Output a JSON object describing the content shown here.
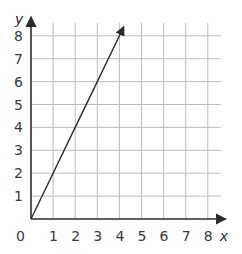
{
  "chart_data": {
    "type": "line",
    "title": "",
    "xlabel": "x",
    "ylabel": "y",
    "xlim": [
      0,
      8
    ],
    "ylim": [
      0,
      8
    ],
    "grid": true,
    "x_ticks": [
      "0",
      "1",
      "2",
      "3",
      "4",
      "5",
      "6",
      "7",
      "8"
    ],
    "y_ticks": [
      "1",
      "2",
      "3",
      "4",
      "5",
      "6",
      "7",
      "8"
    ],
    "series": [
      {
        "name": "y = 2x",
        "x": [
          0,
          1,
          2,
          3,
          4,
          4.2
        ],
        "y": [
          0,
          2,
          4,
          6,
          8,
          8.4
        ],
        "arrow_end": true
      }
    ],
    "colors": {
      "grid": "#bdbdbd",
      "axis": "#2b2b2b",
      "line": "#2b2b2b"
    }
  }
}
